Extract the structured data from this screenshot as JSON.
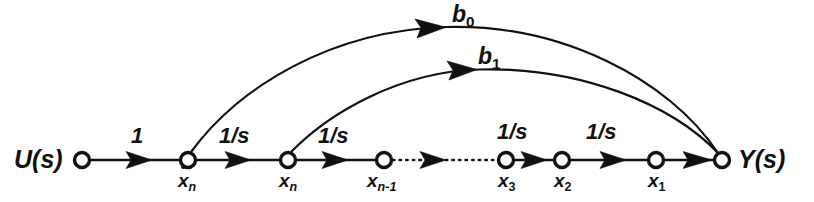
{
  "figure": {
    "type": "signal-flow-graph",
    "background_color": "#ffffff",
    "line_color": "#111111"
  },
  "terminals": {
    "input": {
      "label_text": "U(s)",
      "label_main": "U",
      "label_paren_open": "(",
      "label_var": "s",
      "label_paren_close": ")"
    },
    "output": {
      "label_text": "Y(s)",
      "label_main": "Y",
      "label_paren_open": "(",
      "label_var": "s",
      "label_paren_close": ")"
    }
  },
  "nodes": [
    {
      "id": "u",
      "label": "U(s)",
      "base": "",
      "sub": "",
      "x": 82,
      "y": 160,
      "r": 7.5
    },
    {
      "id": "xndot",
      "label": "xn-dot",
      "base": "x",
      "sub": "n",
      "x": 188,
      "y": 160,
      "r": 7.5,
      "dotted_over": true
    },
    {
      "id": "xn",
      "label": "xn",
      "base": "x",
      "sub": "n",
      "x": 288,
      "y": 160,
      "r": 7.5
    },
    {
      "id": "xnm1",
      "label": "xn-1",
      "base": "x",
      "sub": "n-1",
      "x": 384,
      "y": 160,
      "r": 7.5
    },
    {
      "id": "x3",
      "label": "x3",
      "base": "x",
      "sub": "3",
      "x": 506,
      "y": 160,
      "r": 7.5
    },
    {
      "id": "x2",
      "label": "x2",
      "base": "x",
      "sub": "2",
      "x": 562,
      "y": 160,
      "r": 7.5
    },
    {
      "id": "x1",
      "label": "x1",
      "base": "x",
      "sub": "1",
      "x": 656,
      "y": 160,
      "r": 7.5
    },
    {
      "id": "y",
      "label": "Y(s)",
      "base": "",
      "sub": "",
      "x": 722,
      "y": 160,
      "r": 7.5
    }
  ],
  "edges": [
    {
      "id": "e-u-xndot",
      "from": "u",
      "to": "xndot",
      "gain": "1",
      "style": "solid",
      "gain_numerator": "1",
      "gain_denominator": ""
    },
    {
      "id": "e-xndot-xn",
      "from": "xndot",
      "to": "xn",
      "gain": "1/s",
      "style": "solid",
      "gain_numerator": "1",
      "gain_denominator": "s"
    },
    {
      "id": "e-xn-xnm1",
      "from": "xn",
      "to": "xnm1",
      "gain": "1/s",
      "style": "solid",
      "gain_numerator": "1",
      "gain_denominator": "s"
    },
    {
      "id": "e-xnm1-x3",
      "from": "xnm1",
      "to": "x3",
      "gain": "",
      "style": "dotted",
      "gain_numerator": "",
      "gain_denominator": ""
    },
    {
      "id": "e-x3-x2",
      "from": "x3",
      "to": "x2",
      "gain": "1/s",
      "style": "solid",
      "gain_numerator": "1",
      "gain_denominator": "s"
    },
    {
      "id": "e-x2-x1",
      "from": "x2",
      "to": "x1",
      "gain": "1/s",
      "style": "solid",
      "gain_numerator": "1",
      "gain_denominator": "s"
    },
    {
      "id": "e-x1-y",
      "from": "x1",
      "to": "y",
      "gain": "",
      "style": "solid",
      "gain_numerator": "",
      "gain_denominator": ""
    }
  ],
  "feedforward_arcs": [
    {
      "id": "arc-b0",
      "from": "xndot",
      "to": "y",
      "label": "b0",
      "label_base": "b",
      "label_sub": "0",
      "apex_y": 26
    },
    {
      "id": "arc-b1",
      "from": "xn",
      "to": "y",
      "label": "b1",
      "label_base": "b",
      "label_sub": "1",
      "apex_y": 68
    }
  ],
  "gain_labels": [
    {
      "id": "gain-1",
      "text": "1",
      "numerator": "1",
      "denominator": "",
      "x": 131,
      "y": 126
    },
    {
      "id": "gain-1s-a",
      "text": "1/s",
      "numerator": "1",
      "denominator": "s",
      "x": 219,
      "y": 126
    },
    {
      "id": "gain-1s-b",
      "text": "1/s",
      "numerator": "1",
      "denominator": "s",
      "x": 318,
      "y": 126
    },
    {
      "id": "gain-1s-c",
      "text": "1/s",
      "numerator": "1",
      "denominator": "s",
      "x": 498,
      "y": 122
    },
    {
      "id": "gain-1s-d",
      "text": "1/s",
      "numerator": "1",
      "denominator": "s",
      "x": 586,
      "y": 122
    }
  ],
  "arc_labels": [
    {
      "id": "label-b0",
      "base": "b",
      "sub": "0",
      "x": 452,
      "y": 4
    },
    {
      "id": "label-b1",
      "base": "b",
      "sub": "1",
      "x": 478,
      "y": 46
    }
  ]
}
